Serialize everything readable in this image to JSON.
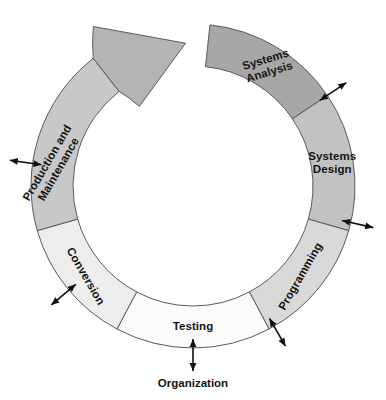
{
  "diagram": {
    "title": "Organization",
    "type": "systems-development-life-cycle-wheel",
    "center": {
      "x": 193,
      "y": 186
    },
    "radius": {
      "outer": 162,
      "inner": 120
    },
    "ring_stroke": "#5a5a5a",
    "arrow_color": "#111111",
    "segments": [
      {
        "label_line1": "Systems",
        "label_line2": "Analysis",
        "fill": "#a7a7a7",
        "start_angle": 6,
        "end_angle": 56,
        "text_rotation": -17,
        "text_radius": 141,
        "text_angle": 32,
        "connector": {
          "angle": 56,
          "kind": "double-arrow-outward"
        }
      },
      {
        "label_line1": "Systems",
        "label_line2": "Design",
        "fill": "#c2c2c2",
        "start_angle": 56,
        "end_angle": 106,
        "text_rotation": 0,
        "text_radius": 141,
        "text_angle": 81,
        "connector": {
          "angle": 103,
          "kind": "double-arrow-outward"
        }
      },
      {
        "label_line1": "Programming",
        "label_line2": "",
        "fill": "#d9d9d9",
        "start_angle": 106,
        "end_angle": 152,
        "text_rotation": -60,
        "text_radius": 141,
        "text_angle": 130,
        "connector": {
          "angle": 150,
          "kind": "double-arrow-outward"
        }
      },
      {
        "label_line1": "Testing",
        "label_line2": "",
        "fill": "#fbfbfb",
        "start_angle": 152,
        "end_angle": 208,
        "text_rotation": 0,
        "text_radius": 141,
        "text_angle": 180,
        "connector": {
          "angle": 180,
          "kind": "double-arrow-outward"
        }
      },
      {
        "label_line1": "Conversion",
        "label_line2": "",
        "fill": "#ededed",
        "start_angle": 208,
        "end_angle": 254,
        "text_rotation": 60,
        "text_radius": 141,
        "text_angle": 230,
        "connector": {
          "angle": 230,
          "kind": "double-arrow-outward"
        }
      },
      {
        "label_line1": "Production and",
        "label_line2": "Maintenance",
        "fill": "#c8c8c8",
        "start_angle": 254,
        "end_angle": 322,
        "text_rotation": -60,
        "text_radius": 141,
        "text_angle": 278,
        "connector": {
          "angle": 278,
          "kind": "double-arrow-outward"
        }
      }
    ],
    "arrowhead": {
      "name": "cycle-direction-arrowhead",
      "description": "large tapered arrowhead at end of ring pointing clockwise toward Systems Analysis",
      "fill": "#b4b4b4",
      "tip_angle": 345
    },
    "bottom_label": {
      "text": "Organization",
      "x": 193,
      "y": 384
    }
  }
}
